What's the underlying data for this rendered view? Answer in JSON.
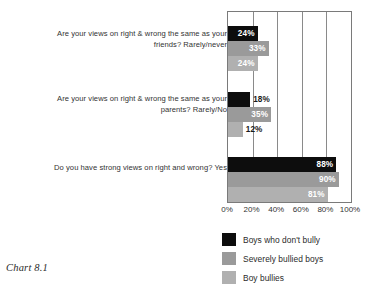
{
  "caption": "Chart 8.1",
  "chart_data": {
    "type": "bar",
    "orientation": "horizontal",
    "title": "",
    "xlabel": "",
    "ylabel": "",
    "xlim": [
      0,
      100
    ],
    "xticks": [
      "0%",
      "20%",
      "40%",
      "60%",
      "80%",
      "100%"
    ],
    "xtick_values": [
      0,
      20,
      40,
      60,
      80,
      100
    ],
    "grid": true,
    "grid_axis": "x",
    "legend_position": "bottom",
    "categories": [
      "Are your views on right & wrong the same as your friends? Rarely/never",
      "Are your views on right & wrong the same as your parents? Rarely/No",
      "Do you have strong views on right and wrong? Yes"
    ],
    "series": [
      {
        "name": "Boys who don't bully",
        "color": "#0d0d0d",
        "values": [
          24,
          18,
          88
        ],
        "labels": [
          "24%",
          "18%",
          "88%"
        ]
      },
      {
        "name": "Severely bullied boys",
        "color": "#9a9a9a",
        "values": [
          33,
          35,
          90
        ],
        "labels": [
          "33%",
          "35%",
          "90%"
        ]
      },
      {
        "name": "Boy bullies",
        "color": "#b0b0b0",
        "values": [
          24,
          12,
          81
        ],
        "labels": [
          "24%",
          "12%",
          "81%"
        ]
      }
    ]
  },
  "legend": {
    "items": [
      {
        "label": "Boys who don't bully",
        "color": "#0d0d0d"
      },
      {
        "label": "Severely bullied boys",
        "color": "#9a9a9a"
      },
      {
        "label": "Boy bullies",
        "color": "#b0b0b0"
      }
    ]
  }
}
